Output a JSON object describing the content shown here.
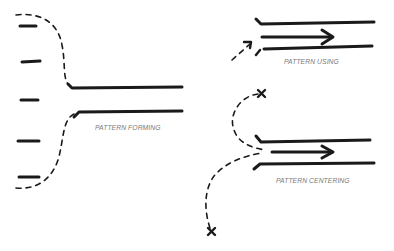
{
  "diagram": {
    "background": "#ffffff",
    "ink_color": "#1a1a1a",
    "label_color": "#7a7a7a",
    "panels": [
      {
        "id": "forming",
        "label": "PATTERN FORMING",
        "description": "Scattered short dashes on the left converge via dashed curves into two parallel channel lines"
      },
      {
        "id": "using",
        "label": "PATTERN USING",
        "description": "Dashed arrow enters a channel between two parallel lines containing a solid arrow"
      },
      {
        "id": "centering",
        "label": "PATTERN CENTERING",
        "description": "Dashed paths from two X marks converge into a channel containing a solid arrow"
      }
    ]
  }
}
